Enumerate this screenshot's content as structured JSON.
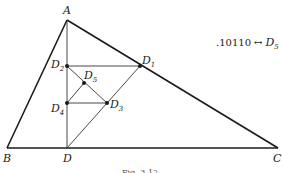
{
  "figure": {
    "annotation": {
      "code": ".10110",
      "arrow": "↔",
      "point": "D",
      "sub": "5"
    },
    "caption": "Fig. 3.12",
    "points": {
      "A": {
        "label": "A",
        "sub": "",
        "x": 67,
        "y": 20
      },
      "B": {
        "label": "B",
        "sub": "",
        "x": 7,
        "y": 148
      },
      "C": {
        "label": "C",
        "sub": "",
        "x": 278,
        "y": 148
      },
      "D": {
        "label": "D",
        "sub": "",
        "x": 67,
        "y": 148
      },
      "D1": {
        "label": "D",
        "sub": "1",
        "x": 140,
        "y": 66
      },
      "D2": {
        "label": "D",
        "sub": "2",
        "x": 67,
        "y": 66
      },
      "D3": {
        "label": "D",
        "sub": "3",
        "x": 107,
        "y": 103
      },
      "D4": {
        "label": "D",
        "sub": "4",
        "x": 67,
        "y": 103
      },
      "D5": {
        "label": "D",
        "sub": "5",
        "x": 84,
        "y": 83
      }
    },
    "segments": [
      [
        "A",
        "B"
      ],
      [
        "A",
        "C"
      ],
      [
        "B",
        "C"
      ],
      [
        "A",
        "D"
      ],
      [
        "D2",
        "D1"
      ],
      [
        "D",
        "D1"
      ],
      [
        "D2",
        "D3"
      ],
      [
        "D4",
        "D3"
      ],
      [
        "D4",
        "D5"
      ]
    ],
    "colors": {
      "stroke": "#1a1a1a",
      "dot": "#1a1a1a",
      "background": "#ffffff"
    }
  }
}
